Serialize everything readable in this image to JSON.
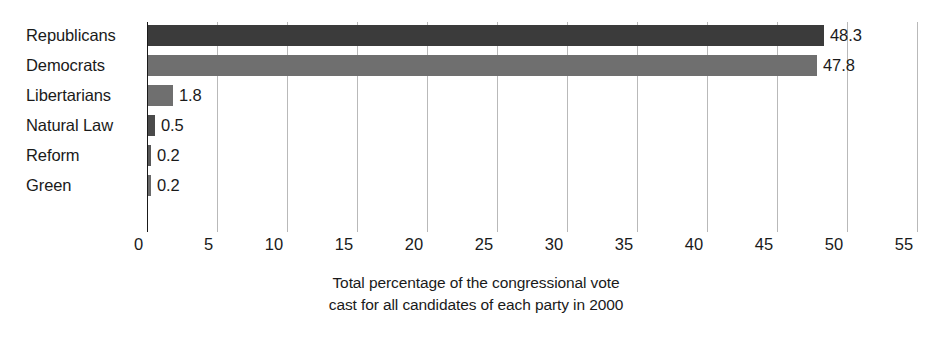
{
  "chart_data": {
    "type": "bar",
    "orientation": "horizontal",
    "title": "",
    "subtitle": "",
    "xlabel": "",
    "ylabel": "",
    "categories": [
      "Republicans",
      "Democrats",
      "Libertarians",
      "Natural Law",
      "Reform",
      "Green"
    ],
    "values": [
      48.3,
      47.8,
      1.8,
      0.5,
      0.2,
      0.2
    ],
    "value_labels": [
      "48.3",
      "47.8",
      "1.8",
      "0.5",
      "0.2",
      "0.2"
    ],
    "bar_colors": [
      "#3b3b3b",
      "#6f6f6f",
      "#6f6f6f",
      "#4a4a4a",
      "#585858",
      "#6a6a6a"
    ],
    "xlim": [
      0,
      55
    ],
    "xticks": [
      0,
      5,
      10,
      15,
      20,
      25,
      30,
      35,
      40,
      45,
      50,
      55
    ],
    "xtick_labels": [
      "0",
      "5",
      "10",
      "15",
      "20",
      "25",
      "30",
      "35",
      "40",
      "45",
      "50",
      "55"
    ],
    "grid": "vertical",
    "legend": "none",
    "caption_lines": [
      "Total percentage of the congressional vote",
      "cast for all candidates of each party in 2000"
    ]
  }
}
